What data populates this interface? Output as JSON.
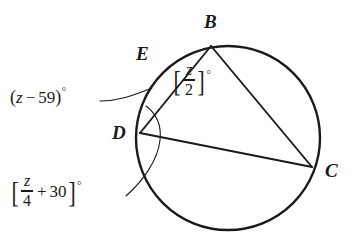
{
  "figure": {
    "background_color": "#ffffff",
    "stroke_color": "#1a1a1a",
    "circle": {
      "cx": 228,
      "cy": 138,
      "r": 92
    },
    "points": [
      {
        "name": "B",
        "label": "B",
        "x": 211,
        "y": 46,
        "label_x": 204,
        "label_y": 12
      },
      {
        "name": "E",
        "label": "E",
        "x": 163,
        "y": 63,
        "label_x": 136,
        "label_y": 44
      },
      {
        "name": "D",
        "label": "D",
        "x": 140,
        "y": 133,
        "label_x": 112,
        "label_y": 123
      },
      {
        "name": "C",
        "label": "C",
        "x": 312,
        "y": 167,
        "label_x": 325,
        "label_y": 161
      }
    ],
    "chords": [
      {
        "name": "chord-d-b",
        "from": "D",
        "to": "B"
      },
      {
        "name": "chord-b-c",
        "from": "B",
        "to": "C"
      },
      {
        "name": "chord-d-c",
        "from": "D",
        "to": "C"
      }
    ],
    "labels": {
      "angle_z_minus_59": {
        "open_paren": "(",
        "variable": "z",
        "operator": "−",
        "value": "59",
        "close_paren": ")",
        "degree": "°",
        "text": "(z − 59)°"
      },
      "angle_z_over_2": {
        "open_bracket": "[",
        "numerator": "z",
        "denominator": "2",
        "close_bracket": "]",
        "degree": "°",
        "text": "[z/2]°"
      },
      "angle_z_over_4_plus_30": {
        "open_bracket": "[",
        "numerator": "z",
        "denominator": "4",
        "operator": "+",
        "value": "30",
        "close_bracket": "]",
        "degree": "°",
        "text": "[z/4 + 30]°"
      }
    }
  }
}
